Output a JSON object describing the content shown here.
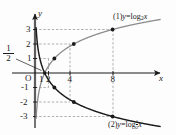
{
  "figure": {
    "axes": {
      "x_axis_label": "x",
      "y_axis_label": "y",
      "origin_label": "O"
    },
    "x_ticks": [
      {
        "value": 1,
        "label": "1"
      },
      {
        "value": 2,
        "label": "2"
      },
      {
        "value": 4,
        "label": "4"
      },
      {
        "value": 8,
        "label": "8"
      }
    ],
    "y_ticks": [
      {
        "value": 3,
        "label": "3"
      },
      {
        "value": 2,
        "label": "2"
      },
      {
        "value": 1,
        "label": "1"
      },
      {
        "value": -1,
        "label": "-1"
      },
      {
        "value": -2,
        "label": "-2"
      },
      {
        "value": -3,
        "label": "-3"
      }
    ],
    "annotations": [
      {
        "name": "half-fraction",
        "numerator": "1",
        "denominator": "2",
        "note": "points to x = 1/2 on the axis"
      }
    ],
    "curve1_label": {
      "prefix": "(1)",
      "lhs": "y",
      "eq": "=",
      "fn": "log",
      "base": "2",
      "arg": "x"
    },
    "curve2_label": {
      "prefix": "(2)",
      "lhs": "y",
      "eq": "=",
      "fn": "log",
      "base_num": "1",
      "base_den": "2",
      "arg": "x"
    },
    "colors": {
      "curve1": "#8c8c8c",
      "curve2": "#1a1a1a",
      "axis": "#1a1a1a",
      "grid": "#9a9a9a",
      "asymptote": "#b8b8b8",
      "point": "#1a1a1a",
      "background": "#fdfdfd"
    }
  },
  "chart_data": {
    "type": "line",
    "xlabel": "x",
    "ylabel": "y",
    "xlim": [
      -0.6,
      9.8
    ],
    "ylim": [
      -3.6,
      3.6
    ],
    "grid": false,
    "dashed_guides": true,
    "legend_position": "inline-right",
    "series": [
      {
        "name": "(1) y = log_2 x",
        "color": "#8c8c8c",
        "marked_points": [
          {
            "x": 1,
            "y": 0
          },
          {
            "x": 2,
            "y": 1
          },
          {
            "x": 4,
            "y": 2
          },
          {
            "x": 8,
            "y": 3
          }
        ],
        "x": [
          0.125,
          0.18,
          0.25,
          0.35,
          0.5,
          0.7,
          1,
          1.4,
          2,
          2.8,
          4,
          5.6,
          8,
          9.5
        ],
        "y": [
          -3,
          -2.47,
          -2,
          -1.51,
          -1,
          -0.51,
          0,
          0.49,
          1,
          1.49,
          2,
          2.49,
          3,
          3.25
        ]
      },
      {
        "name": "(2) y = log_(1/2) x",
        "color": "#1a1a1a",
        "marked_points": [
          {
            "x": 1,
            "y": 0
          },
          {
            "x": 2,
            "y": -1
          },
          {
            "x": 4,
            "y": -2
          },
          {
            "x": 8,
            "y": -3
          }
        ],
        "x": [
          0.125,
          0.18,
          0.25,
          0.35,
          0.5,
          0.7,
          1,
          1.4,
          2,
          2.8,
          4,
          5.6,
          8,
          9.5
        ],
        "y": [
          3,
          2.47,
          2,
          1.51,
          1,
          0.51,
          0,
          -0.49,
          -1,
          -1.49,
          -2,
          -2.49,
          -3,
          -3.25
        ]
      }
    ]
  }
}
